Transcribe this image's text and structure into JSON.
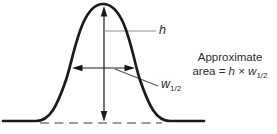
{
  "diagram": {
    "labels": {
      "h": "h",
      "w": "w",
      "w_sub": "1/2",
      "note_line1": "Approximate",
      "note_prefix": "area = ",
      "note_h": "h",
      "note_times": " × ",
      "note_w": "w",
      "note_w_sub": "1/2"
    },
    "colors": {
      "curve": "#1a1a1a",
      "arrow": "#1a1a1a",
      "leader_line": "#8c8c8c",
      "pointer_line": "#555555",
      "baseline_dash": "#7d7d7d",
      "text": "#2b2b2b",
      "background": "#ffffff"
    }
  }
}
